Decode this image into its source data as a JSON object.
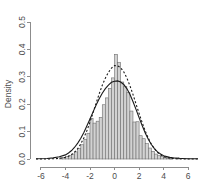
{
  "chart_data": {
    "type": "bar",
    "title": "",
    "subtitle": "",
    "xlabel": "",
    "ylabel": "Density",
    "xlim": [
      -6.4,
      6.8
    ],
    "ylim": [
      0.0,
      0.5
    ],
    "grid": false,
    "legend": null,
    "xticks": [
      "-6",
      "-4",
      "-2",
      "0",
      "2",
      "4",
      "6"
    ],
    "xtick_values": [
      -6,
      -4,
      -2,
      0,
      2,
      4,
      6
    ],
    "yticks": [
      "0.0",
      "0.1",
      "0.2",
      "0.3",
      "0.4",
      "0.5"
    ],
    "ytick_values": [
      0.0,
      0.1,
      0.2,
      0.3,
      0.4,
      0.5
    ],
    "bin_width": 0.25,
    "bin_starts": [
      -4.5,
      -4.25,
      -4.0,
      -3.75,
      -3.5,
      -3.25,
      -3.0,
      -2.75,
      -2.5,
      -2.25,
      -2.0,
      -1.75,
      -1.5,
      -1.25,
      -1.0,
      -0.75,
      -0.5,
      -0.25,
      0.0,
      0.25,
      0.5,
      0.75,
      1.0,
      1.25,
      1.5,
      1.75,
      2.0,
      2.25,
      2.5,
      2.75,
      3.0,
      3.25,
      3.5,
      3.75,
      4.0,
      4.25,
      4.5,
      4.75,
      5.0,
      5.25
    ],
    "values": [
      0.004,
      0.006,
      0.009,
      0.012,
      0.018,
      0.026,
      0.038,
      0.052,
      0.072,
      0.094,
      0.148,
      0.131,
      0.138,
      0.152,
      0.198,
      0.223,
      0.258,
      0.296,
      0.382,
      0.353,
      0.281,
      0.264,
      0.243,
      0.175,
      0.135,
      0.136,
      0.085,
      0.074,
      0.056,
      0.04,
      0.028,
      0.018,
      0.012,
      0.009,
      0.006,
      0.004,
      0.002,
      0.0,
      0.006,
      0.0
    ],
    "series": [
      {
        "name": "kernel density estimate",
        "style": "solid",
        "peak_value": 0.285,
        "peak_x": 0.1,
        "x": [
          -6.4,
          -5.5,
          -5.0,
          -4.5,
          -4.0,
          -3.75,
          -3.5,
          -3.25,
          -3.0,
          -2.75,
          -2.5,
          -2.25,
          -2.0,
          -1.75,
          -1.5,
          -1.25,
          -1.0,
          -0.75,
          -0.5,
          -0.25,
          0.0,
          0.25,
          0.5,
          0.75,
          1.0,
          1.25,
          1.5,
          1.75,
          2.0,
          2.25,
          2.5,
          2.75,
          3.0,
          3.25,
          3.5,
          3.75,
          4.0,
          4.5,
          5.0,
          5.5,
          6.0,
          6.8
        ],
        "y": [
          0.001,
          0.002,
          0.004,
          0.008,
          0.015,
          0.022,
          0.031,
          0.043,
          0.058,
          0.076,
          0.097,
          0.121,
          0.146,
          0.172,
          0.197,
          0.22,
          0.24,
          0.257,
          0.27,
          0.28,
          0.284,
          0.285,
          0.281,
          0.272,
          0.257,
          0.236,
          0.21,
          0.181,
          0.151,
          0.122,
          0.095,
          0.072,
          0.053,
          0.038,
          0.026,
          0.018,
          0.012,
          0.006,
          0.003,
          0.002,
          0.001,
          0.001
        ]
      },
      {
        "name": "normal reference curve",
        "style": "dashed",
        "peak_value": 0.345,
        "peak_x": 0.0,
        "x": [
          -6.4,
          -5.5,
          -5.0,
          -4.5,
          -4.0,
          -3.75,
          -3.5,
          -3.25,
          -3.0,
          -2.75,
          -2.5,
          -2.25,
          -2.0,
          -1.75,
          -1.5,
          -1.25,
          -1.0,
          -0.75,
          -0.5,
          -0.25,
          0.0,
          0.25,
          0.5,
          0.75,
          1.0,
          1.25,
          1.5,
          1.75,
          2.0,
          2.25,
          2.5,
          2.75,
          3.0,
          3.25,
          3.5,
          3.75,
          4.0,
          4.5,
          5.0,
          5.5,
          6.0,
          6.8
        ],
        "y": [
          0.0,
          0.0,
          0.001,
          0.002,
          0.006,
          0.01,
          0.016,
          0.025,
          0.038,
          0.055,
          0.077,
          0.104,
          0.135,
          0.169,
          0.204,
          0.238,
          0.269,
          0.295,
          0.316,
          0.332,
          0.341,
          0.34,
          0.333,
          0.318,
          0.296,
          0.268,
          0.236,
          0.201,
          0.166,
          0.133,
          0.102,
          0.076,
          0.054,
          0.037,
          0.024,
          0.015,
          0.009,
          0.003,
          0.001,
          0.0,
          0.0,
          0.0
        ]
      }
    ],
    "colors": {
      "bar_fill": "#d2d2d2",
      "bar_border": "#6e6e6e",
      "curve": "#1a1a1a",
      "axis": "#8c8c8c",
      "text": "#4d4d4d",
      "background": "#ffffff"
    }
  }
}
